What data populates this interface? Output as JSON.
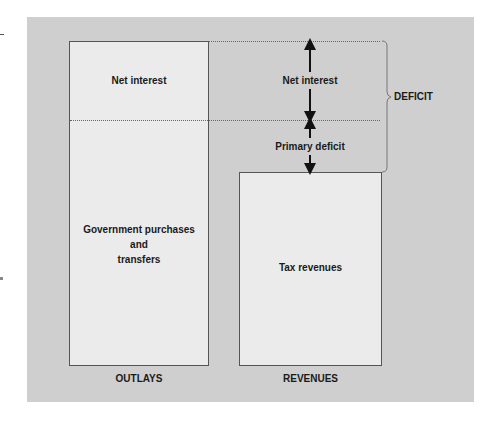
{
  "diagram": {
    "outlays": {
      "title": "OUTLAYS",
      "segments": [
        {
          "label": "Net interest"
        },
        {
          "label_lines": [
            "Government purchases",
            "and",
            "transfers"
          ]
        }
      ]
    },
    "revenues": {
      "title": "REVENUES",
      "segments": [
        {
          "label": "Tax revenues"
        }
      ]
    },
    "gap_annotations": {
      "net_interest": "Net interest",
      "primary_deficit": "Primary deficit",
      "brace_label": "DEFICIT"
    }
  },
  "colors": {
    "panel_background": "#cfcfcf",
    "box_fill": "#ebebeb",
    "box_border": "#555555",
    "text": "#1a1a1a"
  }
}
